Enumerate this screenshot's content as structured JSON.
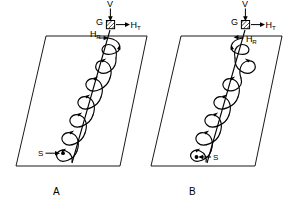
{
  "figure": {
    "background_color": "#ffffff",
    "stroke_color": "#000000",
    "panels": [
      {
        "id": "A",
        "caption": "A",
        "handedness": "right-hand-helix",
        "labels": {
          "vertical_force": "V",
          "ground_point": "G",
          "horizontal_tangential": "H",
          "horizontal_tangential_sub": "T",
          "horizontal_radial": "H",
          "horizontal_radial_sub": "R",
          "start_point": "S"
        }
      },
      {
        "id": "B",
        "caption": "B",
        "handedness": "left-hand-helix",
        "labels": {
          "vertical_force": "V",
          "ground_point": "G",
          "horizontal_tangential": "H",
          "horizontal_tangential_sub": "T",
          "horizontal_radial": "H",
          "horizontal_radial_sub": "R",
          "start_point": "S"
        }
      }
    ]
  }
}
